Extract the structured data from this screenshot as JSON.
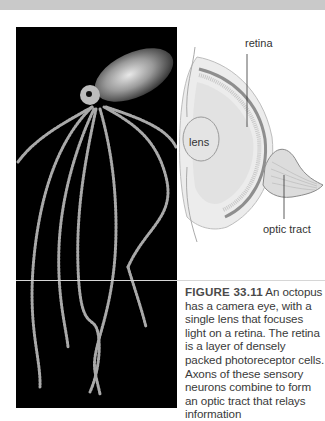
{
  "figure": {
    "number": "FIGURE 33.11",
    "caption": " An octopus has a camera eye, with a single lens that focuses light on a retina. The retina is a layer of densely packed photoreceptor cells. Axons of these sensory neurons combine to form an optic tract that relays information",
    "photo_subject": "octopus",
    "diagram": {
      "subject": "octopus camera eye",
      "labels": {
        "retina": "retina",
        "lens": "lens",
        "optic_tract": "optic tract"
      }
    }
  }
}
